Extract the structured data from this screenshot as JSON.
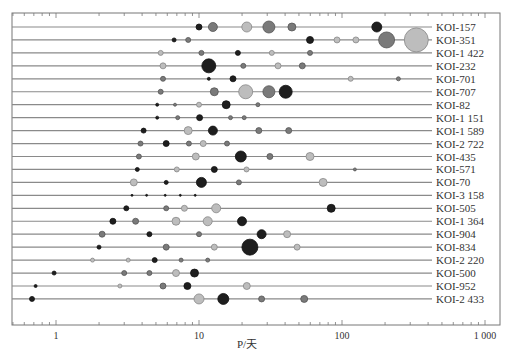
{
  "chart_data": {
    "type": "scatter",
    "subtype": "bubble",
    "title": "",
    "xlabel": "P/天",
    "ylabel": "",
    "xscale": "log",
    "xlim": [
      0.52,
      1050
    ],
    "x_ticks": [
      1,
      10,
      100,
      1000
    ],
    "x_tick_labels": [
      "1",
      "10",
      "100",
      "1 000"
    ],
    "grid": false,
    "legend": null,
    "colors": {
      "dark": "#1e1e1e",
      "mid": "#7a7a7a",
      "light": "#bdbdbd",
      "line": "#8a8a8a",
      "axis": "#777777"
    },
    "systems": [
      {
        "name": "KOI-157",
        "planets": [
          [
            10.0,
            3,
            "dark"
          ],
          [
            12.5,
            4.5,
            "mid"
          ],
          [
            21.6,
            5,
            "light"
          ],
          [
            30.8,
            6,
            "mid"
          ],
          [
            44.6,
            4,
            "mid"
          ],
          [
            175,
            5,
            "dark"
          ]
        ]
      },
      {
        "name": "KOI-351",
        "planets": [
          [
            6.7,
            2,
            "dark"
          ],
          [
            8.4,
            2.5,
            "mid"
          ],
          [
            59.7,
            3.5,
            "dark"
          ],
          [
            92.3,
            3,
            "light"
          ],
          [
            125,
            3,
            "light"
          ],
          [
            205,
            8,
            "mid"
          ],
          [
            331,
            12,
            "light"
          ]
        ]
      },
      {
        "name": "KOI-1 422",
        "planets": [
          [
            5.4,
            2.5,
            "light"
          ],
          [
            10.4,
            2.5,
            "mid"
          ],
          [
            18.7,
            2.5,
            "dark"
          ],
          [
            32.3,
            2.5,
            "light"
          ],
          [
            59.7,
            2.5,
            "mid"
          ]
        ]
      },
      {
        "name": "KOI-232",
        "planets": [
          [
            5.6,
            3,
            "light"
          ],
          [
            11.7,
            7,
            "dark"
          ],
          [
            20.4,
            2.5,
            "mid"
          ],
          [
            35.7,
            3,
            "light"
          ],
          [
            52.8,
            3,
            "mid"
          ]
        ]
      },
      {
        "name": "KOI-701",
        "planets": [
          [
            5.6,
            2.5,
            "mid"
          ],
          [
            11.7,
            1.5,
            "dark"
          ],
          [
            17.3,
            3,
            "dark"
          ],
          [
            115,
            2.5,
            "light"
          ],
          [
            248,
            2,
            "mid"
          ]
        ]
      },
      {
        "name": "KOI-707",
        "planets": [
          [
            5.4,
            2.5,
            "mid"
          ],
          [
            12.8,
            4,
            "mid"
          ],
          [
            21.2,
            7,
            "light"
          ],
          [
            30.8,
            6,
            "mid"
          ],
          [
            40.4,
            6.5,
            "dark"
          ]
        ]
      },
      {
        "name": "KOI-82",
        "planets": [
          [
            5.1,
            1.5,
            "dark"
          ],
          [
            6.8,
            1.5,
            "mid"
          ],
          [
            10.0,
            2.5,
            "light"
          ],
          [
            15.5,
            4,
            "dark"
          ],
          [
            25.8,
            2,
            "mid"
          ]
        ]
      },
      {
        "name": "KOI-1 151",
        "planets": [
          [
            5.1,
            1.5,
            "dark"
          ],
          [
            7.1,
            2,
            "mid"
          ],
          [
            10.1,
            3,
            "dark"
          ],
          [
            16.6,
            2,
            "mid"
          ],
          [
            20.7,
            2,
            "mid"
          ]
        ]
      },
      {
        "name": "KOI-1 589",
        "planets": [
          [
            4.1,
            2.5,
            "dark"
          ],
          [
            8.4,
            4,
            "light"
          ],
          [
            12.5,
            4.5,
            "dark"
          ],
          [
            26.2,
            3,
            "mid"
          ],
          [
            42.4,
            3,
            "mid"
          ]
        ]
      },
      {
        "name": "KOI-2 722",
        "planets": [
          [
            3.9,
            2.5,
            "mid"
          ],
          [
            5.9,
            3,
            "dark"
          ],
          [
            8.5,
            2.5,
            "mid"
          ],
          [
            10.7,
            3,
            "light"
          ],
          [
            15.7,
            2.5,
            "mid"
          ]
        ]
      },
      {
        "name": "KOI-435",
        "planets": [
          [
            3.8,
            2.5,
            "mid"
          ],
          [
            9.5,
            3.5,
            "light"
          ],
          [
            19.6,
            5.5,
            "dark"
          ],
          [
            31.3,
            3,
            "mid"
          ],
          [
            59.7,
            4,
            "light"
          ]
        ]
      },
      {
        "name": "KOI-571",
        "planets": [
          [
            3.7,
            2,
            "dark"
          ],
          [
            7.0,
            2.5,
            "light"
          ],
          [
            12.8,
            3,
            "dark"
          ],
          [
            21.5,
            2.5,
            "light"
          ],
          [
            123,
            1.5,
            "mid"
          ]
        ]
      },
      {
        "name": "KOI-70",
        "planets": [
          [
            3.5,
            3.5,
            "light"
          ],
          [
            5.9,
            2,
            "dark"
          ],
          [
            10.4,
            5,
            "dark"
          ],
          [
            19.0,
            2.5,
            "mid"
          ],
          [
            73.8,
            4,
            "light"
          ]
        ]
      },
      {
        "name": "KOI-3 158",
        "planets": [
          [
            3.4,
            1,
            "dark"
          ],
          [
            4.3,
            1,
            "dark"
          ],
          [
            5.8,
            1,
            "dark"
          ],
          [
            7.4,
            1,
            "dark"
          ],
          [
            9.4,
            1,
            "dark"
          ]
        ]
      },
      {
        "name": "KOI-505",
        "planets": [
          [
            3.1,
            2.5,
            "dark"
          ],
          [
            5.9,
            2.5,
            "mid"
          ],
          [
            7.9,
            3,
            "light"
          ],
          [
            13.2,
            4.5,
            "light"
          ],
          [
            84,
            4,
            "dark"
          ]
        ]
      },
      {
        "name": "KOI-1 364",
        "planets": [
          [
            2.5,
            3,
            "dark"
          ],
          [
            3.6,
            3,
            "mid"
          ],
          [
            6.9,
            4,
            "light"
          ],
          [
            11.5,
            4.5,
            "light"
          ],
          [
            20.0,
            4.5,
            "dark"
          ]
        ]
      },
      {
        "name": "KOI-904",
        "planets": [
          [
            2.1,
            3,
            "mid"
          ],
          [
            4.5,
            2.5,
            "dark"
          ],
          [
            10.0,
            2.5,
            "mid"
          ],
          [
            27.4,
            4.5,
            "dark"
          ],
          [
            41.3,
            3.5,
            "light"
          ]
        ]
      },
      {
        "name": "KOI-834",
        "planets": [
          [
            2.0,
            2,
            "dark"
          ],
          [
            5.9,
            3,
            "mid"
          ],
          [
            12.8,
            3,
            "light"
          ],
          [
            22.7,
            8,
            "dark"
          ],
          [
            48.5,
            3,
            "light"
          ]
        ]
      },
      {
        "name": "KOI-2 220",
        "planets": [
          [
            1.8,
            2,
            "light"
          ],
          [
            3.2,
            2,
            "light"
          ],
          [
            4.9,
            2.5,
            "dark"
          ],
          [
            7.5,
            2,
            "mid"
          ],
          [
            11.5,
            2,
            "mid"
          ]
        ]
      },
      {
        "name": "KOI-500",
        "planets": [
          [
            0.97,
            2,
            "dark"
          ],
          [
            3.0,
            2.5,
            "mid"
          ],
          [
            4.5,
            2.5,
            "mid"
          ],
          [
            6.9,
            3.5,
            "light"
          ],
          [
            9.3,
            4,
            "dark"
          ]
        ]
      },
      {
        "name": "KOI-952",
        "planets": [
          [
            0.72,
            1.5,
            "dark"
          ],
          [
            2.8,
            2,
            "light"
          ],
          [
            5.6,
            3,
            "mid"
          ],
          [
            8.3,
            3.5,
            "dark"
          ],
          [
            21.6,
            3.5,
            "light"
          ]
        ]
      },
      {
        "name": "KOI-2 433",
        "planets": [
          [
            0.68,
            2.5,
            "dark"
          ],
          [
            10.0,
            5,
            "light"
          ],
          [
            14.8,
            5.5,
            "dark"
          ],
          [
            27.4,
            3,
            "mid"
          ],
          [
            54.4,
            3.5,
            "mid"
          ]
        ]
      }
    ],
    "planet_tuple_format": [
      "period_days",
      "radius_px",
      "shade"
    ]
  },
  "layout": {
    "plot": {
      "left": 12,
      "right": 500,
      "top": 13,
      "bottom": 325
    },
    "decade_px": 143,
    "x_at_1": 56,
    "row_top": 27,
    "row_step": 12.95,
    "line_end": 432,
    "label_x": 436
  }
}
